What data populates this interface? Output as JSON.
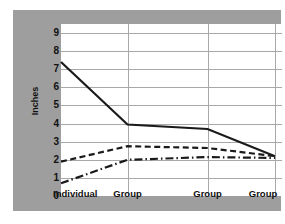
{
  "chart_data": {
    "type": "line",
    "title": "",
    "xlabel": "",
    "ylabel": "Inches",
    "categories": [
      "Individual",
      "Group",
      "Group",
      "Group"
    ],
    "ylim": [
      0,
      9.5
    ],
    "yticks": [
      0,
      1,
      2,
      3,
      4,
      5,
      6,
      7,
      8,
      9
    ],
    "ytick_labels": [
      "0",
      "1",
      "2",
      "3",
      "4",
      "5",
      "6",
      "7",
      "8",
      "9"
    ],
    "grid": true,
    "legend": "none",
    "series": [
      {
        "name": "solid-series",
        "style": "solid",
        "color": "#1a1a1a",
        "values": [
          7.4,
          3.95,
          3.7,
          2.2
        ]
      },
      {
        "name": "dashed-series",
        "style": "dashed",
        "color": "#1a1a1a",
        "values": [
          1.9,
          2.75,
          2.65,
          2.2
        ]
      },
      {
        "name": "dash-dot-series",
        "style": "dashdot",
        "color": "#1a1a1a",
        "values": [
          0.7,
          2.0,
          2.15,
          2.1
        ]
      }
    ],
    "colors": {
      "panel_background": "#9e9e9e",
      "plot_background": "#ffffff",
      "gridline": "#a8a8a8",
      "line": "#1a1a1a",
      "text": "#111111"
    }
  }
}
